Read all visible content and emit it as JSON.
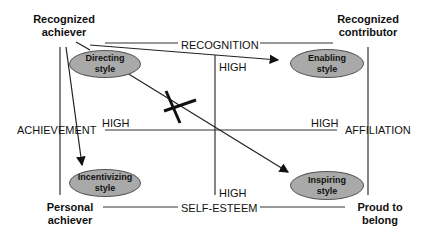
{
  "corners": {
    "top_left": [
      "Recognized",
      "achiever"
    ],
    "top_right": [
      "Recognized",
      "contributor"
    ],
    "bottom_left": [
      "Personal",
      "achiever"
    ],
    "bottom_right": [
      "Proud to",
      "belong"
    ]
  },
  "axes": {
    "top": "RECOGNITION",
    "bottom": "SELF-ESTEEM",
    "left": "ACHIEVEMENT",
    "right": "AFFILIATION"
  },
  "high_labels": {
    "top": "HIGH",
    "bottom": "HIGH",
    "left": "HIGH",
    "right": "HIGH"
  },
  "styles": {
    "directing": [
      "Directing",
      "style"
    ],
    "enabling": [
      "Enabling",
      "style"
    ],
    "incentivizing": [
      "Incentivizing",
      "style"
    ],
    "inspiring": [
      "Inspiring",
      "style"
    ]
  },
  "colors": {
    "ellipse_fill": "#a9a9a9",
    "line": "#222222"
  }
}
